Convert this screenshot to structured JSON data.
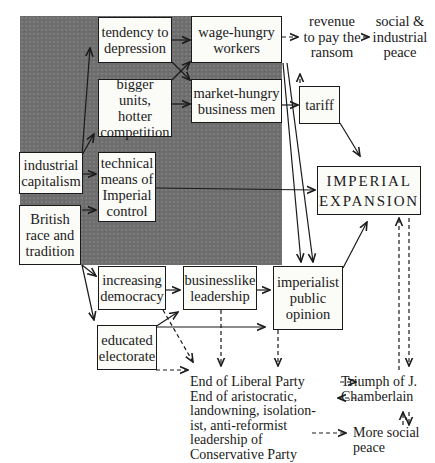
{
  "diagram": {
    "nodes": {
      "tendency": "tendency to\ndepression",
      "bigger": "bigger units,\nhotter\ncompetition",
      "industrial": "industrial\ncapitalism",
      "technical": "technical\nmeans of\nImperial\ncontrol",
      "british": "British\nrace and\ntradition",
      "wage": "wage-hungry\nworkers",
      "market": "market-hungry\nbusiness men",
      "tariff": "tariff",
      "imperial": "IMPERIAL\nEXPANSION",
      "democracy": "increasing\ndemocracy",
      "businesslike": "businesslike\nleadership",
      "opinion": "imperialist\npublic\nopinion",
      "educated": "educated\nelectorate"
    },
    "labels": {
      "revenue": "revenue\nto pay the\nransom",
      "social_peace": "social &\nindustrial\npeace",
      "end_liberal": "End of Liberal Party\nEnd of aristocratic,\nlandowning, isolation-\nist, anti-reformist\nleadership of\nConservative Party",
      "triumph": "Triumph of J.\nChamberlain",
      "more_social": "More social\npeace"
    },
    "colors": {
      "shade": "#6e6e6e",
      "ink": "#1a1a1a",
      "paper": "#ffffff"
    }
  }
}
